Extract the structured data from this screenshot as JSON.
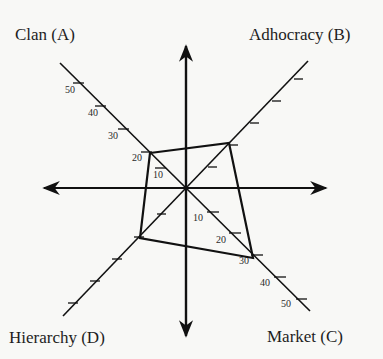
{
  "diagram": {
    "quadrants": {
      "clan": "Clan (A)",
      "adhocracy": "Adhocracy (B)",
      "market": "Market (C)",
      "hierarchy": "Hierarchy (D)"
    },
    "tick_labels": {
      "clan": [
        "10",
        "20",
        "30",
        "40",
        "50"
      ],
      "market": [
        "10",
        "20",
        "30",
        "40",
        "50"
      ]
    },
    "profile_values": {
      "clan": 20,
      "adhocracy": 20,
      "market": 30,
      "hierarchy": 20
    },
    "colors": {
      "line": "#111111",
      "background": "#f8f8f6"
    }
  }
}
